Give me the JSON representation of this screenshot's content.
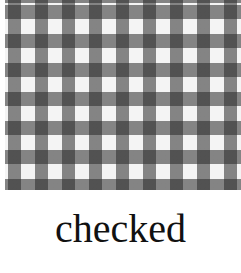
{
  "image": {
    "description": "gingham checkered fabric pattern in black, gray and white",
    "pattern_colors": [
      "#1e1e1e",
      "#8a8a8a",
      "#f4f4f4"
    ]
  },
  "caption": {
    "text": "checked"
  }
}
